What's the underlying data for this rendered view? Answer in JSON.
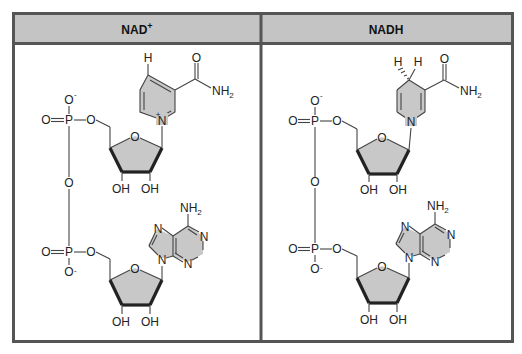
{
  "panels": [
    {
      "id": "nad-plus",
      "title": "NAD",
      "title_superscript": "+",
      "nicotinamide": {
        "ring_H": "H",
        "carbonyl_O": "O",
        "amide": "NH",
        "amide_sub": "2",
        "ring_N": "N",
        "ring_N_charge": "+"
      },
      "phosphate_top": {
        "P": "P",
        "O_double": "O",
        "O_minus": "O",
        "minus": "-",
        "O_ester": "O"
      },
      "bridge_O": "O",
      "phosphate_bottom": {
        "P": "P",
        "O_double": "O",
        "O_minus": "O",
        "minus": "-",
        "O_ester": "O"
      },
      "ribose_top": {
        "ring_O": "O",
        "OH_left": "OH",
        "OH_right": "OH"
      },
      "ribose_bottom": {
        "ring_O": "O",
        "OH_left": "OH",
        "OH_right": "OH"
      },
      "adenine": {
        "amine": "NH",
        "amine_sub": "2",
        "N1": "N",
        "N3": "N",
        "N7": "N",
        "N9": "N"
      }
    },
    {
      "id": "nadh",
      "title": "NADH",
      "title_superscript": "",
      "nicotinamide": {
        "ring_H1": "H",
        "ring_H2": "H",
        "carbonyl_O": "O",
        "amide": "NH",
        "amide_sub": "2",
        "ring_N": "N"
      },
      "phosphate_top": {
        "P": "P",
        "O_double": "O",
        "O_minus": "O",
        "minus": "-",
        "O_ester": "O"
      },
      "bridge_O": "O",
      "phosphate_bottom": {
        "P": "P",
        "O_double": "O",
        "O_minus": "O",
        "minus": "-",
        "O_ester": "O"
      },
      "ribose_top": {
        "ring_O": "O",
        "OH_left": "OH",
        "OH_right": "OH"
      },
      "ribose_bottom": {
        "ring_O": "O",
        "OH_left": "OH",
        "OH_right": "OH"
      },
      "adenine": {
        "amine": "NH",
        "amine_sub": "2",
        "N1": "N",
        "N3": "N",
        "N7": "N",
        "N9": "N"
      }
    }
  ],
  "colors": {
    "header_fill": "#c4c4c4",
    "border": "#555555",
    "ring_fill": "#c8c8c8",
    "bond": "#444444"
  }
}
